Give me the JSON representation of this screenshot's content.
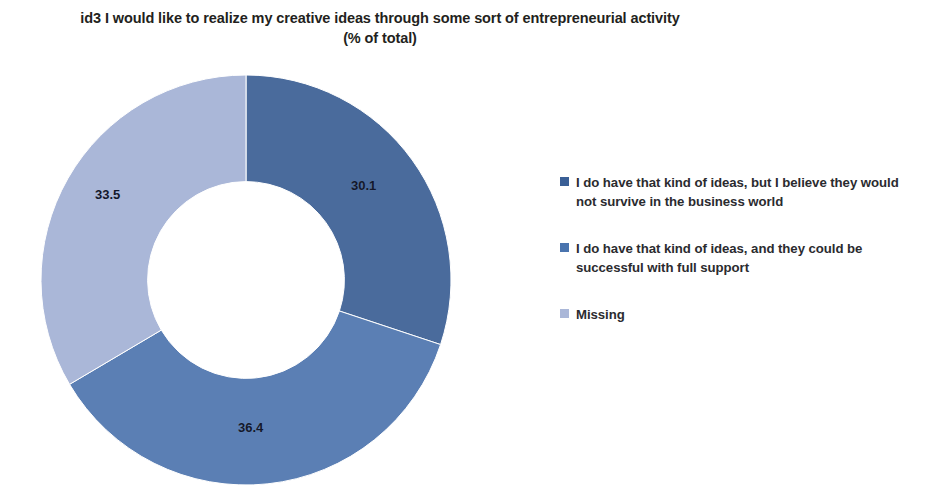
{
  "chart_data": {
    "type": "pie",
    "variant": "donut",
    "title": "id3 I would like to realize my creative ideas through some sort of entrepreneurial activity",
    "subtitle": "(% of total)",
    "units": "% of total",
    "categories": [
      "I do have that kind of ideas, but I believe they would not survive in the business world",
      "I do have that kind of ideas, and they could be successful with full support",
      "Missing"
    ],
    "values": [
      30.1,
      36.4,
      33.5
    ],
    "data_labels": [
      "30.1",
      "36.4",
      "33.5"
    ],
    "colors": [
      "#4a6b9c",
      "#5b7fb4",
      "#aab7d8"
    ],
    "start_angle_deg": 0,
    "direction": "clockwise",
    "hole_ratio": 0.48,
    "legend": {
      "position": "right",
      "entries": [
        {
          "label": "I do have that kind of ideas, but I believe they would not survive in the business world",
          "color": "#3a5f96"
        },
        {
          "label": "I do have that kind of ideas, and they could be successful with full support",
          "color": "#4a74ae"
        },
        {
          "label": "Missing",
          "color": "#aab7d8"
        }
      ]
    },
    "grid": false,
    "total": 100.0
  },
  "figure": {
    "background": "#ffffff",
    "title_line1": "id3 I would like to realize my creative ideas through some sort of entrepreneurial activity",
    "title_line2": "(% of total)"
  }
}
